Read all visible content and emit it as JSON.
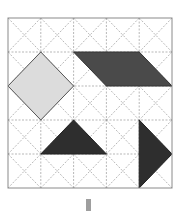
{
  "diagram": {
    "grid": {
      "rows": 5,
      "cols": 5,
      "origin_px": [
        8,
        18
      ],
      "cell_px": [
        32.8,
        34
      ],
      "border_color": "#8a8a8a",
      "line_color": "#9a9a9a",
      "diagonals": true
    },
    "shapes": [
      {
        "name": "light-diamond",
        "fill": "#dcdcdc",
        "stroke": "#555555",
        "points": [
          [
            0,
            2
          ],
          [
            1,
            1
          ],
          [
            2,
            2
          ],
          [
            1,
            3
          ]
        ]
      },
      {
        "name": "dark-parallelogram",
        "fill": "#4a4a4a",
        "stroke": "#333333",
        "points": [
          [
            2,
            1
          ],
          [
            4,
            1
          ],
          [
            5,
            2
          ],
          [
            3,
            2
          ]
        ]
      },
      {
        "name": "dark-triangle-left",
        "fill": "#2e2e2e",
        "stroke": "#222222",
        "points": [
          [
            1,
            4
          ],
          [
            2,
            3
          ],
          [
            3,
            4
          ]
        ]
      },
      {
        "name": "dark-triangle-right",
        "fill": "#2e2e2e",
        "stroke": "#222222",
        "points": [
          [
            4,
            3
          ],
          [
            5,
            4
          ],
          [
            4,
            5
          ]
        ]
      }
    ],
    "indicator": {
      "name": "down-bar",
      "color": "#9e9e9e",
      "x": 86,
      "y": 199,
      "w": 5,
      "h": 12
    }
  }
}
